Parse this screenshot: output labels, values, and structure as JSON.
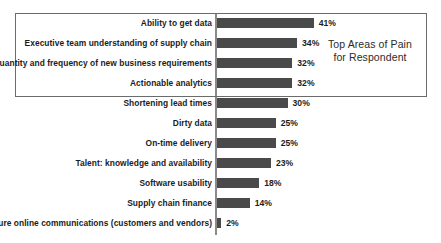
{
  "chart_data": {
    "type": "bar",
    "orientation": "horizontal",
    "title": "",
    "xlabel": "",
    "ylabel": "",
    "xlim": [
      0,
      45
    ],
    "grid": false,
    "legend": null,
    "value_suffix": "%",
    "categories": [
      "Ability to get data",
      "Executive team understanding of supply chain",
      "Quantity and frequency of new business requirements",
      "Actionable analytics",
      "Shortening lead times",
      "Dirty data",
      "On-time delivery",
      "Talent: knowledge and availability",
      "Software usability",
      "Supply chain finance",
      "Secure online communications (customers and vendors)"
    ],
    "values": [
      41,
      34,
      32,
      32,
      30,
      25,
      25,
      23,
      18,
      14,
      2
    ],
    "value_labels": [
      "41%",
      "34%",
      "32%",
      "32%",
      "30%",
      "25%",
      "25%",
      "23%",
      "18%",
      "14%",
      "2%"
    ],
    "annotations": [
      {
        "name": "top-areas-callout",
        "line1": "Top Areas of Pain",
        "line2": "for Respondent",
        "covers_categories": [
          0,
          1,
          2,
          3
        ]
      }
    ],
    "colors": {
      "bar": "#4a4a4a",
      "axis": "#8a8a8a",
      "box_border": "#6b6b6b",
      "text": "#1c1c1c",
      "background": "#ffffff"
    }
  }
}
